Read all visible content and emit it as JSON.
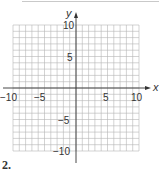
{
  "figure": {
    "problem_number": "2.",
    "x_axis_label": "x",
    "y_axis_label": "y",
    "x_range": [
      -10,
      10
    ],
    "y_range": [
      -10,
      10
    ],
    "grid_step": 1,
    "x_ticks": {
      "neg10": "−10",
      "neg5": "−5",
      "pos5": "5",
      "pos10": "10"
    },
    "y_ticks": {
      "pos10": "10",
      "pos5": "5",
      "neg5": "−5",
      "neg10": "−10"
    },
    "colors": {
      "grid": "#b5b5b5",
      "axis": "#333333"
    }
  }
}
